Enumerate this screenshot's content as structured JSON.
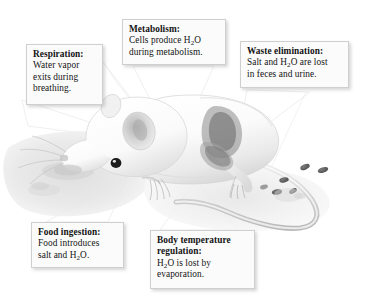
{
  "figure": {
    "background_color": "#ffffff",
    "box_fill": "#fbfbfb",
    "box_border": "#cfcfcf",
    "text_color": "#131313",
    "art_gray": "#d8d8d8"
  },
  "callouts": [
    {
      "id": "respiration",
      "heading": "Respiration:",
      "lines": [
        "Water vapor",
        "exits during",
        "breathing."
      ],
      "plain_text": "Respiration: Water vapor exits during breathing.",
      "anchor": "mouse-snout-nose"
    },
    {
      "id": "metabolism",
      "heading": "Metabolism:",
      "lines": [
        "Cells produce H2O",
        "during metabolism."
      ],
      "plain_text": "Metabolism: Cells produce H2O during metabolism.",
      "anchor": "mouse-body-core"
    },
    {
      "id": "waste_elimination",
      "heading": "Waste elimination:",
      "lines": [
        "Salt and H2O are lost",
        "in feces and urine."
      ],
      "plain_text": "Waste elimination: Salt and H2O are lost in feces and urine.",
      "anchor": "mouse-hindquarters-feces"
    },
    {
      "id": "food_ingestion",
      "heading": "Food ingestion:",
      "lines": [
        "Food introduces",
        "salt and H2O."
      ],
      "plain_text": "Food ingestion: Food introduces salt and H2O.",
      "anchor": "food-pellets-ground"
    },
    {
      "id": "body_temperature_regulation",
      "heading_lines": [
        "Body temperature",
        "regulation:"
      ],
      "lines": [
        "H2O is lost by",
        "evaporation."
      ],
      "plain_text": "Body temperature regulation: H2O is lost by evaporation.",
      "anchor": "mouse-flank-skin"
    }
  ],
  "illustration": {
    "animal": "white mouse",
    "parts": [
      "head",
      "ear",
      "eye",
      "whiskers",
      "forepaw",
      "hind-leg",
      "tail",
      "fecal-pellets",
      "food-pellets",
      "ground-shadow"
    ],
    "style": "grayscale pencil rendering"
  }
}
